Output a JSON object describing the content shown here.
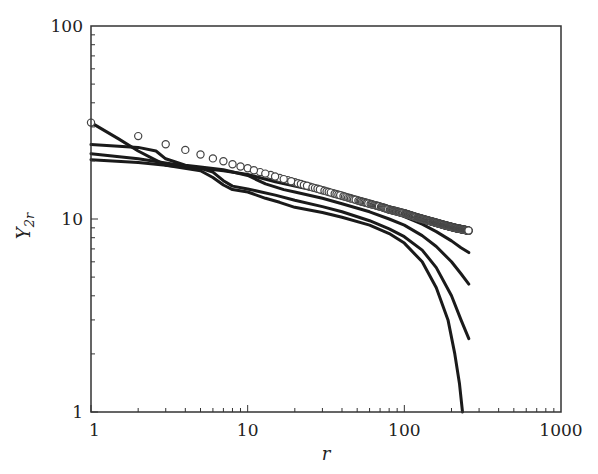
{
  "chart_data": {
    "type": "line",
    "title": "",
    "xlabel": "r",
    "ylabel": "Y",
    "ylabel_subscript": "2r",
    "xscale": "log",
    "yscale": "log",
    "xlim": [
      1,
      1000
    ],
    "ylim": [
      1,
      100
    ],
    "x_ticks": [
      {
        "value": 1,
        "label": "1"
      },
      {
        "value": 10,
        "label": "10"
      },
      {
        "value": 100,
        "label": "100"
      },
      {
        "value": 1000,
        "label": "1000"
      }
    ],
    "y_ticks": [
      {
        "value": 1,
        "label": "1"
      },
      {
        "value": 10,
        "label": "10"
      },
      {
        "value": 100,
        "label": "100"
      }
    ],
    "grid": false,
    "legend": null,
    "series": [
      {
        "name": "reference (open circles)",
        "style": "markers",
        "marker": "open-circle",
        "color": "#444444",
        "points": [
          [
            1,
            31.6
          ],
          [
            2,
            26.9
          ],
          [
            3,
            24.4
          ],
          [
            4,
            22.8
          ],
          [
            5,
            21.6
          ],
          [
            6,
            20.6
          ],
          [
            7,
            19.9
          ],
          [
            8,
            19.2
          ],
          [
            9,
            18.7
          ],
          [
            10,
            18.3
          ],
          [
            12,
            17.5
          ],
          [
            14,
            16.9
          ],
          [
            16,
            16.3
          ],
          [
            18,
            15.9
          ],
          [
            20,
            15.5
          ],
          [
            25,
            14.7
          ],
          [
            30,
            14.1
          ],
          [
            35,
            13.6
          ],
          [
            40,
            13.2
          ],
          [
            50,
            12.5
          ],
          [
            60,
            12.0
          ],
          [
            70,
            11.6
          ],
          [
            80,
            11.2
          ],
          [
            100,
            10.7
          ],
          [
            120,
            10.2
          ],
          [
            150,
            9.7
          ],
          [
            180,
            9.3
          ],
          [
            210,
            9.0
          ],
          [
            240,
            8.8
          ],
          [
            258,
            8.7
          ]
        ]
      },
      {
        "name": "curve 1",
        "style": "line",
        "color": "#1a1a1a",
        "points": [
          [
            1,
            31.6
          ],
          [
            1.5,
            26.0
          ],
          [
            2,
            22.5
          ],
          [
            2.5,
            20.5
          ],
          [
            3,
            19.0
          ],
          [
            4,
            18.6
          ],
          [
            5,
            18.3
          ],
          [
            7,
            17.8
          ],
          [
            10,
            17.0
          ],
          [
            15,
            15.6
          ],
          [
            20,
            14.8
          ],
          [
            30,
            13.8
          ],
          [
            40,
            13.0
          ],
          [
            60,
            11.9
          ],
          [
            80,
            11.0
          ],
          [
            100,
            10.3
          ],
          [
            130,
            9.4
          ],
          [
            160,
            8.6
          ],
          [
            200,
            7.7
          ],
          [
            230,
            7.1
          ],
          [
            258,
            6.7
          ]
        ]
      },
      {
        "name": "curve 2",
        "style": "line",
        "color": "#1a1a1a",
        "points": [
          [
            1,
            24.3
          ],
          [
            2,
            23.5
          ],
          [
            2.6,
            22.5
          ],
          [
            3,
            20.5
          ],
          [
            4,
            19.0
          ],
          [
            5,
            18.6
          ],
          [
            7,
            18.0
          ],
          [
            10,
            16.8
          ],
          [
            13,
            15.2
          ],
          [
            17,
            14.2
          ],
          [
            20,
            13.8
          ],
          [
            30,
            12.8
          ],
          [
            40,
            12.0
          ],
          [
            60,
            10.9
          ],
          [
            80,
            10.0
          ],
          [
            100,
            9.3
          ],
          [
            130,
            8.2
          ],
          [
            160,
            7.2
          ],
          [
            200,
            6.0
          ],
          [
            230,
            5.2
          ],
          [
            258,
            4.6
          ]
        ]
      },
      {
        "name": "curve 3",
        "style": "line",
        "color": "#1a1a1a",
        "points": [
          [
            1,
            21.8
          ],
          [
            2,
            20.5
          ],
          [
            3,
            19.5
          ],
          [
            4,
            18.8
          ],
          [
            5,
            18.3
          ],
          [
            6,
            17.5
          ],
          [
            7,
            15.8
          ],
          [
            8,
            14.8
          ],
          [
            10,
            14.3
          ],
          [
            15,
            13.3
          ],
          [
            20,
            12.5
          ],
          [
            30,
            11.6
          ],
          [
            40,
            10.9
          ],
          [
            60,
            9.8
          ],
          [
            80,
            8.9
          ],
          [
            100,
            8.1
          ],
          [
            130,
            6.9
          ],
          [
            160,
            5.6
          ],
          [
            200,
            4.0
          ],
          [
            230,
            3.0
          ],
          [
            258,
            2.4
          ]
        ]
      },
      {
        "name": "curve 4",
        "style": "line",
        "color": "#1a1a1a",
        "points": [
          [
            1,
            20.3
          ],
          [
            2,
            19.6
          ],
          [
            3,
            19.0
          ],
          [
            5,
            17.8
          ],
          [
            6,
            16.4
          ],
          [
            7,
            15.0
          ],
          [
            8,
            14.2
          ],
          [
            10,
            13.8
          ],
          [
            13,
            12.8
          ],
          [
            16,
            12.2
          ],
          [
            20,
            11.5
          ],
          [
            30,
            10.8
          ],
          [
            40,
            10.2
          ],
          [
            60,
            9.3
          ],
          [
            80,
            8.4
          ],
          [
            100,
            7.5
          ],
          [
            130,
            6.0
          ],
          [
            160,
            4.4
          ],
          [
            190,
            3.0
          ],
          [
            210,
            2.0
          ],
          [
            225,
            1.4
          ],
          [
            235,
            1.0
          ]
        ]
      }
    ]
  }
}
